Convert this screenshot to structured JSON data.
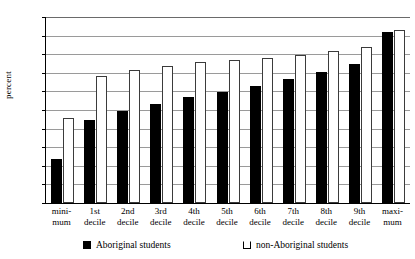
{
  "chart_data": {
    "type": "bar",
    "title": "",
    "xlabel": "",
    "ylabel": "percent",
    "ylim": [
      0,
      100
    ],
    "yticks": [
      0,
      10,
      20,
      30,
      40,
      50,
      60,
      70,
      80,
      90,
      100
    ],
    "grid": true,
    "legend_position": "bottom",
    "categories": [
      "mini-mum",
      "1st decile",
      "2nd decile",
      "3rd decile",
      "4th decile",
      "5th decile",
      "6th decile",
      "7th decile",
      "8th decile",
      "9th decile",
      "maxi-mum"
    ],
    "category_lines": [
      [
        "mini-",
        "mum"
      ],
      [
        "1st",
        "decile"
      ],
      [
        "2nd",
        "decile"
      ],
      [
        "3rd",
        "decile"
      ],
      [
        "4th",
        "decile"
      ],
      [
        "5th",
        "decile"
      ],
      [
        "6th",
        "decile"
      ],
      [
        "7th",
        "decile"
      ],
      [
        "8th",
        "decile"
      ],
      [
        "9th",
        "decile"
      ],
      [
        "maxi-",
        "mum"
      ]
    ],
    "series": [
      {
        "name": "Aboriginal students",
        "color": "#000000",
        "values": [
          23.5,
          44.5,
          49.5,
          53.5,
          57,
          59.5,
          63,
          66.5,
          70.5,
          75,
          92
        ]
      },
      {
        "name": "non-Aboriginal students",
        "color": "#ffffff",
        "values": [
          45.5,
          68.5,
          71.5,
          73.5,
          76,
          77,
          78,
          79.5,
          81.5,
          84,
          93
        ]
      }
    ]
  },
  "legend": {
    "aboriginal_label": "Aboriginal students",
    "non_aboriginal_label": "non-Aboriginal students"
  }
}
